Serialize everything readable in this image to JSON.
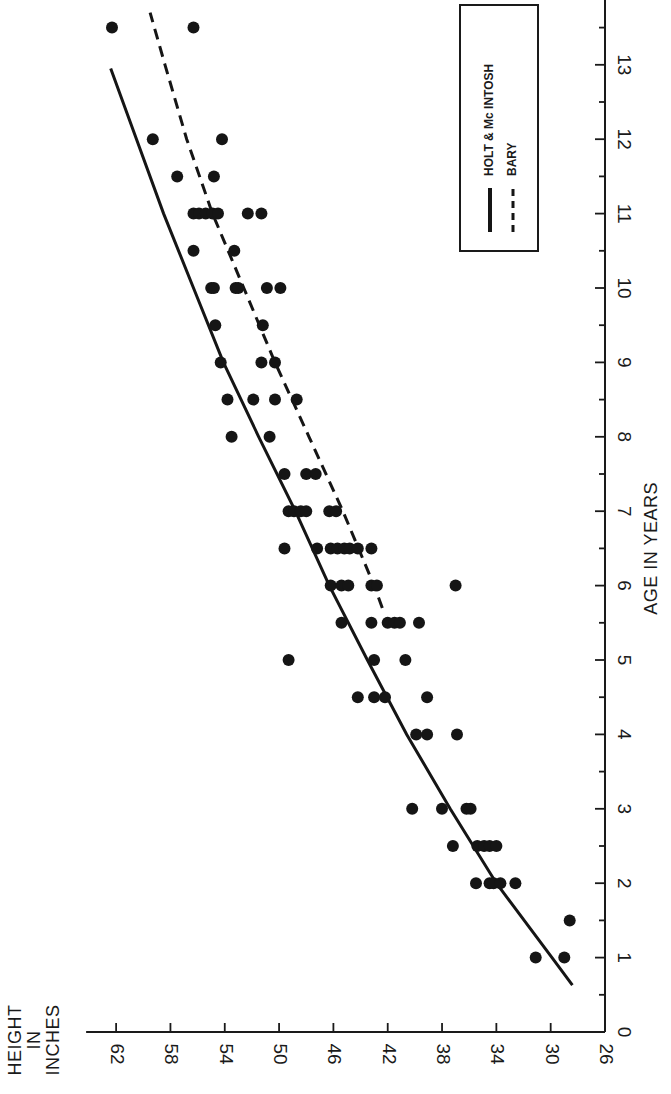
{
  "chart_data": {
    "type": "scatter",
    "orientation": "rotated-90 (height runs along bottom horizontal axis, decreasing left-to-right; age runs along right vertical axis, increasing upward)",
    "title": "",
    "xlabel": "AGE IN YEARS",
    "ylabel": "HEIGHT IN INCHES",
    "ylabel_lines": [
      "HEIGHT",
      "IN",
      "INCHES"
    ],
    "xlim": [
      0,
      14
    ],
    "ylim": [
      26,
      62
    ],
    "x_ticks": [
      "0",
      "1",
      "2",
      "3",
      "4",
      "5",
      "6",
      "7",
      "8",
      "9",
      "10",
      "11",
      "12",
      "13"
    ],
    "x_minor_tick_step": 0.5,
    "y_ticks": [
      "26",
      "30",
      "34",
      "38",
      "42",
      "46",
      "50",
      "54",
      "58",
      "62"
    ],
    "grid": false,
    "legend": {
      "position": "upper-right (rotated frame)",
      "entries": [
        {
          "label": "HOLT & Mc INTOSH",
          "style": "solid"
        },
        {
          "label": "BARY",
          "style": "dashed"
        }
      ]
    },
    "series": [
      {
        "name": "HOLT & Mc INTOSH",
        "kind": "line",
        "style": "solid",
        "points": [
          [
            0.63,
            28.4
          ],
          [
            1,
            29.9
          ],
          [
            2,
            34.0
          ],
          [
            3,
            37.4
          ],
          [
            4,
            40.6
          ],
          [
            5,
            43.5
          ],
          [
            6,
            46.3
          ],
          [
            7,
            48.8
          ],
          [
            8,
            51.5
          ],
          [
            9,
            54.1
          ],
          [
            10,
            56.3
          ],
          [
            11,
            58.5
          ],
          [
            12,
            60.5
          ],
          [
            12.95,
            62.4
          ]
        ]
      },
      {
        "name": "BARY",
        "kind": "line",
        "style": "dashed",
        "points": [
          [
            5.7,
            42.4
          ],
          [
            6,
            43.0
          ],
          [
            7,
            45.3
          ],
          [
            8,
            47.8
          ],
          [
            9,
            50.3
          ],
          [
            10,
            52.6
          ],
          [
            11,
            54.9
          ],
          [
            12,
            56.8
          ],
          [
            13,
            58.4
          ],
          [
            13.7,
            59.5
          ]
        ]
      },
      {
        "name": "Observations",
        "kind": "scatter",
        "points": [
          [
            1,
            31.1
          ],
          [
            1,
            29.0
          ],
          [
            1.5,
            28.6
          ],
          [
            2,
            35.5
          ],
          [
            2,
            34.5
          ],
          [
            2,
            34.2
          ],
          [
            2,
            33.7
          ],
          [
            2,
            32.6
          ],
          [
            2.5,
            37.2
          ],
          [
            2.5,
            35.4
          ],
          [
            2.5,
            34.9
          ],
          [
            2.5,
            34.5
          ],
          [
            2.5,
            34.0
          ],
          [
            3,
            40.2
          ],
          [
            3,
            38.0
          ],
          [
            3,
            36.2
          ],
          [
            3,
            35.9
          ],
          [
            4,
            39.9
          ],
          [
            4,
            39.1
          ],
          [
            4,
            36.9
          ],
          [
            4.5,
            44.2
          ],
          [
            4.5,
            43.0
          ],
          [
            4.5,
            42.2
          ],
          [
            4.5,
            39.1
          ],
          [
            5,
            49.3
          ],
          [
            5,
            43.0
          ],
          [
            5,
            40.7
          ],
          [
            5.5,
            45.4
          ],
          [
            5.5,
            43.2
          ],
          [
            5.5,
            42.0
          ],
          [
            5.5,
            41.5
          ],
          [
            5.5,
            41.1
          ],
          [
            5.5,
            39.7
          ],
          [
            6,
            46.2
          ],
          [
            6,
            45.4
          ],
          [
            6,
            44.9
          ],
          [
            6,
            43.2
          ],
          [
            6,
            42.8
          ],
          [
            6,
            37.0
          ],
          [
            6.5,
            49.6
          ],
          [
            6.5,
            47.2
          ],
          [
            6.5,
            46.2
          ],
          [
            6.5,
            45.7
          ],
          [
            6.5,
            45.2
          ],
          [
            6.5,
            44.8
          ],
          [
            6.5,
            44.2
          ],
          [
            6.5,
            43.2
          ],
          [
            7,
            49.3
          ],
          [
            7,
            48.9
          ],
          [
            7,
            48.4
          ],
          [
            7,
            48.0
          ],
          [
            7,
            46.3
          ],
          [
            7,
            45.8
          ],
          [
            7.5,
            49.6
          ],
          [
            7.5,
            48.0
          ],
          [
            7.5,
            47.3
          ],
          [
            8,
            53.5
          ],
          [
            8,
            50.7
          ],
          [
            8.5,
            53.8
          ],
          [
            8.5,
            51.9
          ],
          [
            8.5,
            50.3
          ],
          [
            8.5,
            48.7
          ],
          [
            9,
            54.3
          ],
          [
            9,
            51.3
          ],
          [
            9,
            50.3
          ],
          [
            9.5,
            54.7
          ],
          [
            9.5,
            51.2
          ],
          [
            10,
            55.0
          ],
          [
            10,
            54.8
          ],
          [
            10,
            53.2
          ],
          [
            10,
            53.0
          ],
          [
            10,
            50.9
          ],
          [
            10,
            49.9
          ],
          [
            10.5,
            56.3
          ],
          [
            10.5,
            53.3
          ],
          [
            11,
            56.3
          ],
          [
            11,
            55.9
          ],
          [
            11,
            55.4
          ],
          [
            11,
            54.9
          ],
          [
            11,
            54.5
          ],
          [
            11,
            52.3
          ],
          [
            11,
            51.3
          ],
          [
            11.5,
            57.5
          ],
          [
            11.5,
            54.8
          ],
          [
            12,
            59.3
          ],
          [
            12,
            54.2
          ],
          [
            13.5,
            62.3
          ],
          [
            13.5,
            56.3
          ]
        ]
      }
    ]
  },
  "layout": {
    "origin_px": [
      605,
      1032
    ],
    "px_per_inch": 13.58,
    "px_per_year": 74.4,
    "dot_radius": 6
  }
}
